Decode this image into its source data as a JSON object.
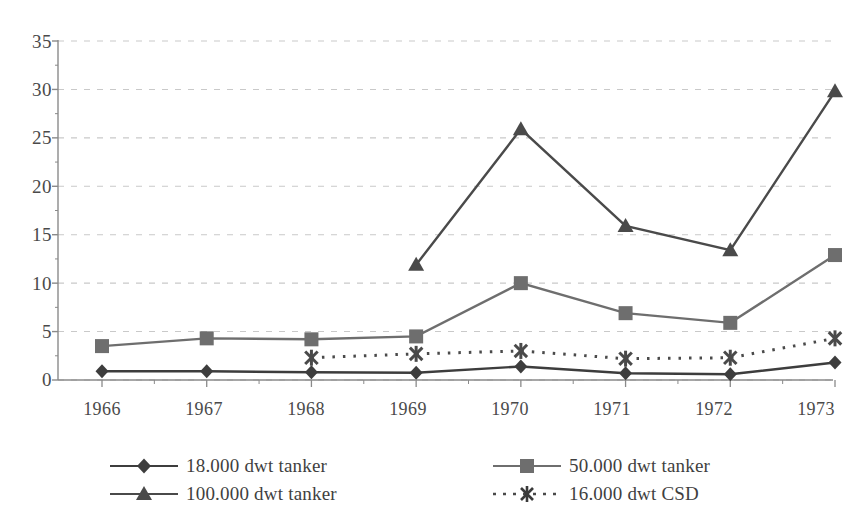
{
  "chart_data": {
    "type": "line",
    "title": "",
    "subtitle": "",
    "xlabel": "",
    "ylabel": "",
    "categories": [
      "1966",
      "1967",
      "1968",
      "1969",
      "1970",
      "1971",
      "1972",
      "1973"
    ],
    "ylim": [
      0,
      35
    ],
    "yticks": [
      "0",
      "5",
      "10",
      "15",
      "20",
      "25",
      "30",
      "35"
    ],
    "ytick_values": [
      0,
      5,
      10,
      15,
      20,
      25,
      30,
      35
    ],
    "grid": "horizontal-dashed",
    "legend_position": "bottom",
    "series": [
      {
        "name": "18.000 dwt tanker",
        "marker": "diamond",
        "line_style": "solid",
        "color": "#3d3d3d",
        "values": [
          0.9,
          0.9,
          0.8,
          0.75,
          1.4,
          0.7,
          0.6,
          1.8
        ]
      },
      {
        "name": "50.000 dwt tanker",
        "marker": "square",
        "line_style": "solid",
        "color": "#6e6e6e",
        "values": [
          3.5,
          4.3,
          4.2,
          4.5,
          10.0,
          6.9,
          5.9,
          12.9
        ]
      },
      {
        "name": "100.000 dwt tanker",
        "marker": "triangle",
        "line_style": "solid",
        "color": "#4a4a4a",
        "values": [
          null,
          null,
          null,
          11.9,
          25.9,
          15.9,
          13.4,
          29.8
        ]
      },
      {
        "name": "16.000 dwt CSD",
        "marker": "asterisk",
        "line_style": "dotted",
        "color": "#4a4a4a",
        "values": [
          null,
          null,
          2.3,
          2.7,
          3.0,
          2.2,
          2.3,
          4.3
        ]
      }
    ]
  },
  "legend": {
    "items": [
      {
        "label": "18.000 dwt tanker",
        "marker": "diamond-marker-icon",
        "line_style": "solid"
      },
      {
        "label": "50.000 dwt tanker",
        "marker": "square-marker-icon",
        "line_style": "solid"
      },
      {
        "label": "100.000 dwt tanker",
        "marker": "triangle-marker-icon",
        "line_style": "solid"
      },
      {
        "label": "16.000 dwt CSD",
        "marker": "asterisk-marker-icon",
        "line_style": "dotted"
      }
    ]
  },
  "colors": {
    "axis": "#8a8a8a",
    "grid": "#c9c9c9",
    "text": "#4a4a4a",
    "series_18k": "#3d3d3d",
    "series_50k": "#6e6e6e",
    "series_100k": "#4a4a4a",
    "series_csd": "#4a4a4a"
  }
}
